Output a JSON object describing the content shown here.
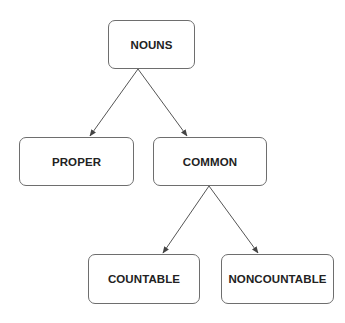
{
  "diagram": {
    "type": "tree",
    "nodes": [
      {
        "id": "nouns",
        "label": "NOUNS"
      },
      {
        "id": "proper",
        "label": "PROPER"
      },
      {
        "id": "common",
        "label": "COMMON"
      },
      {
        "id": "countable",
        "label": "COUNTABLE"
      },
      {
        "id": "noncountable",
        "label": "NONCOUNTABLE"
      }
    ],
    "edges": [
      {
        "from": "nouns",
        "to": "proper"
      },
      {
        "from": "nouns",
        "to": "common"
      },
      {
        "from": "common",
        "to": "countable"
      },
      {
        "from": "common",
        "to": "noncountable"
      }
    ],
    "colors": {
      "line": "#555555",
      "border": "#6e6e6e",
      "text": "#222222"
    }
  }
}
